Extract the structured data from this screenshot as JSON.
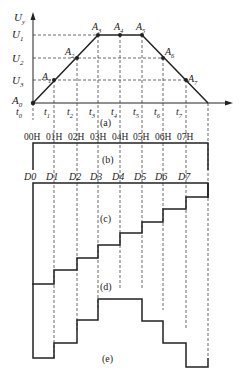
{
  "figure": {
    "y_axis_label": "U",
    "y_axis_sub": "y",
    "y_levels": [
      {
        "label": "U",
        "sub": "1"
      },
      {
        "label": "U",
        "sub": "2"
      },
      {
        "label": "U",
        "sub": "3"
      }
    ],
    "origin_label": {
      "label": "A",
      "sub": "0"
    },
    "time_labels": [
      {
        "label": "t",
        "sub": "0"
      },
      {
        "label": "t",
        "sub": "1"
      },
      {
        "label": "t",
        "sub": "2"
      },
      {
        "label": "t",
        "sub": "3"
      },
      {
        "label": "t",
        "sub": "4"
      },
      {
        "label": "t",
        "sub": "5"
      },
      {
        "label": "t",
        "sub": "6"
      },
      {
        "label": "t",
        "sub": "7"
      }
    ],
    "points": [
      {
        "label": "A",
        "sub": "1"
      },
      {
        "label": "A",
        "sub": "2"
      },
      {
        "label": "A",
        "sub": "3"
      },
      {
        "label": "A",
        "sub": "4"
      },
      {
        "label": "A",
        "sub": "5"
      },
      {
        "label": "A",
        "sub": "6"
      },
      {
        "label": "A",
        "sub": "7"
      }
    ],
    "addresses": [
      "00H",
      "01H",
      "02H",
      "03H",
      "04H",
      "05H",
      "06H",
      "07H"
    ],
    "data_labels": [
      "D0",
      "D1",
      "D2",
      "D3",
      "D4",
      "D5",
      "D6",
      "D7"
    ],
    "panel_labels": [
      "(a)",
      "(b)",
      "(c)",
      "(d)",
      "(e)"
    ]
  }
}
